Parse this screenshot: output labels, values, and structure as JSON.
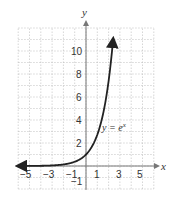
{
  "chart_data": {
    "type": "line",
    "title": "",
    "xlabel": "x",
    "ylabel": "y",
    "xlim": [
      -6,
      6
    ],
    "ylim": [
      -2,
      12
    ],
    "grid": true,
    "x_ticks": [
      -5,
      -3,
      -1,
      1,
      3,
      5
    ],
    "y_ticks": [
      -1,
      2,
      4,
      6,
      8,
      10
    ],
    "series": [
      {
        "name": "y = e^x",
        "label": "y = e^x",
        "function": "exp(x)",
        "x": [
          -6,
          -5,
          -4,
          -3,
          -2,
          -1,
          0,
          1,
          2,
          2.4
        ],
        "y": [
          0.0025,
          0.0067,
          0.018,
          0.05,
          0.135,
          0.368,
          1,
          2.718,
          7.389,
          11.02
        ]
      }
    ],
    "annotations": [
      {
        "text": "y = e^x",
        "x": 1.4,
        "y": 3.3
      }
    ]
  },
  "labels": {
    "x_axis": "x",
    "y_axis": "y",
    "curve_label_main": "y = e",
    "curve_label_sup": "x",
    "tick_x": [
      "−5",
      "−3",
      "−1",
      "1",
      "3",
      "5"
    ],
    "tick_y": [
      "10",
      "8",
      "6",
      "4",
      "2",
      "−1"
    ]
  }
}
